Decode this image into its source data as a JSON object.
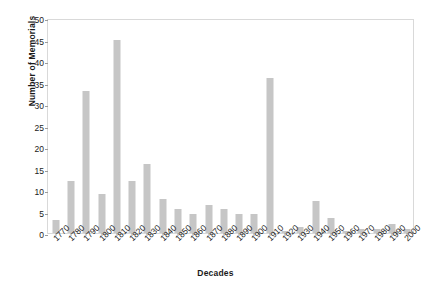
{
  "chart_data": {
    "type": "bar",
    "title": "",
    "xlabel": "Decades",
    "ylabel": "Number of Memorials",
    "ylim": [
      0,
      50
    ],
    "ytick_step": 5,
    "yticks": [
      "0",
      "5",
      "10",
      "15",
      "20",
      "25",
      "30",
      "35",
      "40",
      "45",
      "50"
    ],
    "grid": false,
    "legend": null,
    "bar_color": "#c6c6c6",
    "categories": [
      "1770",
      "1780",
      "1790",
      "1800",
      "1810",
      "1820",
      "1830",
      "1840",
      "1850",
      "1860",
      "1870",
      "1880",
      "1890",
      "1900",
      "1910",
      "1920",
      "1930",
      "1940",
      "1950",
      "1960",
      "1970",
      "1980",
      "1990",
      "2000"
    ],
    "values": [
      3,
      12,
      33,
      9,
      45,
      12,
      16,
      8,
      5.5,
      4.5,
      6.5,
      5.5,
      4.5,
      4.5,
      36,
      0.5,
      1.5,
      7.5,
      3.5,
      0.5,
      1,
      1,
      2,
      1
    ]
  }
}
